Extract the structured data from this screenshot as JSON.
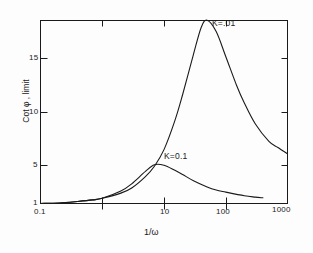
{
  "chart_data": {
    "type": "line",
    "title": "",
    "xlabel": "1/ω",
    "ylabel": "Cot φ , limit",
    "xscale": "log",
    "xlim": [
      0.1,
      1000
    ],
    "ylim": [
      0,
      19.6
    ],
    "grid": false,
    "legend": "inline-curve-labels",
    "xticks": [
      {
        "value": 0.1,
        "label": "0.1"
      },
      {
        "value": 1,
        "label": ""
      },
      {
        "value": 10,
        "label": "10"
      },
      {
        "value": 100,
        "label": "100"
      },
      {
        "value": 1000,
        "label": "1000"
      }
    ],
    "yticks": [
      {
        "value": 1,
        "label": "1"
      },
      {
        "value": 5,
        "label": "5"
      },
      {
        "value": 10,
        "label": "10"
      },
      {
        "value": 15,
        "label": "15"
      }
    ],
    "series": [
      {
        "name": "K=.01",
        "label": "K=.01",
        "color": "#1a1a1a",
        "x": [
          0.1,
          0.2,
          0.4,
          0.7,
          1,
          2,
          3,
          5,
          7,
          10,
          15,
          20,
          30,
          40,
          50,
          70,
          100,
          150,
          200,
          300,
          500,
          700,
          1000
        ],
        "y": [
          1.0,
          1.05,
          1.2,
          1.35,
          1.5,
          2.0,
          2.5,
          3.6,
          4.6,
          6.2,
          9.0,
          11.5,
          15.4,
          18.0,
          18.7,
          17.6,
          15.2,
          12.4,
          10.7,
          8.7,
          7.0,
          6.4,
          5.8
        ]
      },
      {
        "name": "K=0.1",
        "label": "K=0.1",
        "color": "#1a1a1a",
        "x": [
          0.1,
          0.2,
          0.4,
          0.7,
          1,
          2,
          3,
          5,
          7,
          10,
          15,
          20,
          30,
          50,
          70,
          100,
          200,
          300,
          400
        ],
        "y": [
          1.0,
          1.05,
          1.2,
          1.35,
          1.5,
          2.2,
          2.9,
          4.1,
          4.75,
          4.7,
          4.2,
          3.8,
          3.2,
          2.6,
          2.3,
          2.1,
          1.75,
          1.62,
          1.55
        ]
      }
    ]
  },
  "annotations": {
    "upper_curve_label": "K=.01",
    "lower_curve_label": "K=0.1"
  }
}
